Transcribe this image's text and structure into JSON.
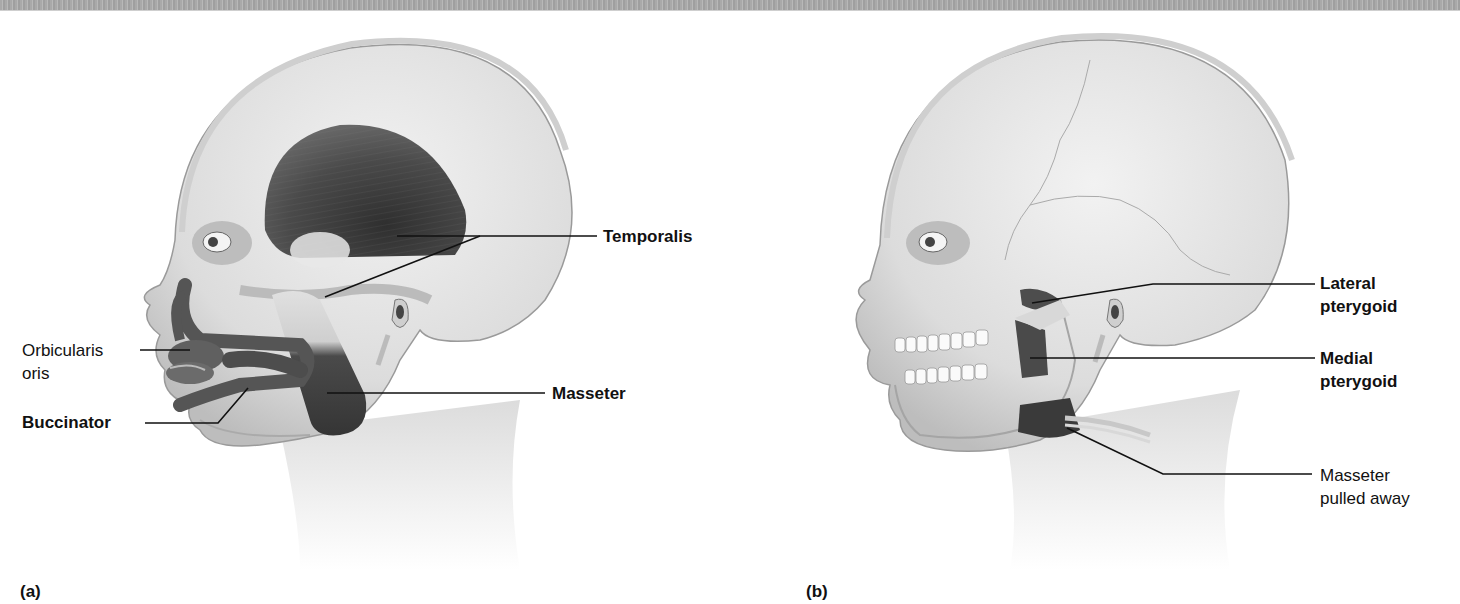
{
  "figure": {
    "panels": [
      {
        "id": "a",
        "panel_label": "(a)",
        "labels": [
          {
            "key": "temporalis",
            "lines": [
              "Temporalis"
            ],
            "bold": true
          },
          {
            "key": "orbicularis_oris",
            "lines": [
              "Orbicularis",
              "oris"
            ],
            "bold": false
          },
          {
            "key": "buccinator",
            "lines": [
              "Buccinator"
            ],
            "bold": true
          },
          {
            "key": "masseter",
            "lines": [
              "Masseter"
            ],
            "bold": true
          }
        ]
      },
      {
        "id": "b",
        "panel_label": "(b)",
        "labels": [
          {
            "key": "lateral_pterygoid",
            "lines": [
              "Lateral",
              "pterygoid"
            ],
            "bold": true
          },
          {
            "key": "medial_pterygoid",
            "lines": [
              "Medial",
              "pterygoid"
            ],
            "bold": true
          },
          {
            "key": "masseter_pulled_away",
            "lines": [
              "Masseter",
              "pulled away"
            ],
            "bold": false
          }
        ]
      }
    ],
    "colors": {
      "skin": "#e6e6e6",
      "skin_shadow": "#c4c4c4",
      "muscle_dark": "#3c3c3c",
      "muscle_mid": "#5e5e5e",
      "tendon": "#d9d9d9",
      "leader_line": "#111111",
      "top_band": "#a9a9a9"
    }
  }
}
